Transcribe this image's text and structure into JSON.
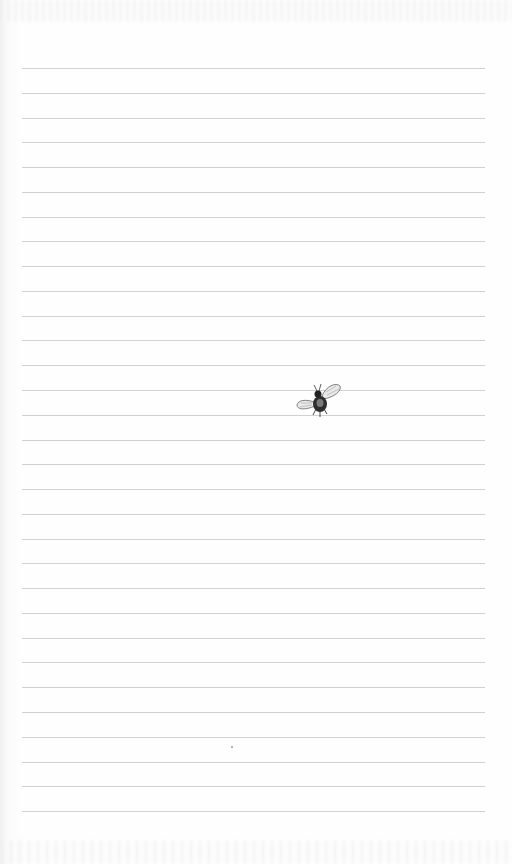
{
  "page": {
    "type": "lined-notepad-page",
    "background_color": "#fdfdfd",
    "rule_color": "#c9c9c9",
    "rule_count": 31,
    "rule_start_y": 68,
    "rule_spacing": 24.77,
    "rule_left": 22,
    "rule_right": 485
  },
  "illustration": {
    "icon": "bee-icon",
    "description": "small bee illustration"
  }
}
